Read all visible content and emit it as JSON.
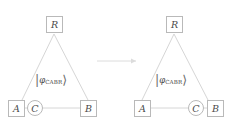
{
  "figure": {
    "title": "",
    "arrow_icon": "right-arrow-icon",
    "line_color": "#d6d6d6",
    "node_border_color": "#b9b9b9",
    "text_color": "#4a4a4a",
    "background": "#ffffff"
  },
  "diagrams": [
    {
      "id": "left",
      "nodes": {
        "top": {
          "label": "R",
          "shape": "square"
        },
        "bottom_left": {
          "label": "A",
          "shape": "square"
        },
        "bottom_mid": {
          "label": "C",
          "shape": "circle"
        },
        "bottom_right": {
          "label": "B",
          "shape": "square"
        }
      },
      "state_label": {
        "open": "|",
        "symbol": "φ",
        "subscript": "CABR",
        "close": "⟩"
      }
    },
    {
      "id": "right",
      "nodes": {
        "top": {
          "label": "R",
          "shape": "square"
        },
        "bottom_left": {
          "label": "A",
          "shape": "square"
        },
        "bottom_mid": {
          "label": "C",
          "shape": "circle"
        },
        "bottom_right": {
          "label": "B",
          "shape": "square"
        }
      },
      "state_label": {
        "open": "|",
        "symbol": "φ",
        "subscript": "CABR",
        "close": "⟩"
      }
    }
  ]
}
